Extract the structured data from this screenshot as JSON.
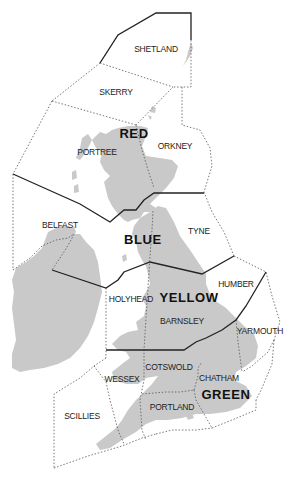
{
  "map": {
    "background": "#ffffff",
    "land_color": "#c9c9c9",
    "zones": [
      {
        "name": "SHETLAND",
        "x": 156,
        "y": 52
      },
      {
        "name": "SKERRY",
        "x": 116,
        "y": 95
      },
      {
        "name": "PORTREE",
        "x": 97,
        "y": 155
      },
      {
        "name": "ORKNEY",
        "x": 175,
        "y": 149
      },
      {
        "name": "BELFAST",
        "x": 60,
        "y": 228
      },
      {
        "name": "TYNE",
        "x": 199,
        "y": 234
      },
      {
        "name": "HUMBER",
        "x": 236,
        "y": 287
      },
      {
        "name": "HOLYHEAD",
        "x": 131,
        "y": 302
      },
      {
        "name": "BARNSLEY",
        "x": 182,
        "y": 324
      },
      {
        "name": "YARMOUTH",
        "x": 260,
        "y": 334
      },
      {
        "name": "COTSWOLD",
        "x": 169,
        "y": 370
      },
      {
        "name": "WESSEX",
        "x": 122,
        "y": 382
      },
      {
        "name": "CHATHAM",
        "x": 219,
        "y": 381
      },
      {
        "name": "PORTLAND",
        "x": 172,
        "y": 410
      },
      {
        "name": "SCILLIES",
        "x": 82,
        "y": 419
      }
    ],
    "regions": [
      {
        "name": "RED",
        "x": 134,
        "y": 138
      },
      {
        "name": "BLUE",
        "x": 143,
        "y": 244
      },
      {
        "name": "YELLOW",
        "x": 189,
        "y": 302
      },
      {
        "name": "GREEN",
        "x": 226,
        "y": 399
      }
    ]
  }
}
